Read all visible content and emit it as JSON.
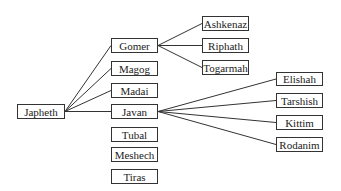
{
  "diagram": {
    "root": {
      "id": "japheth",
      "label": "Japheth"
    },
    "sons": [
      {
        "id": "gomer",
        "label": "Gomer",
        "linked": true
      },
      {
        "id": "magog",
        "label": "Magog",
        "linked": true
      },
      {
        "id": "madai",
        "label": "Madai",
        "linked": true
      },
      {
        "id": "javan",
        "label": "Javan",
        "linked": true
      },
      {
        "id": "tubal",
        "label": "Tubal",
        "linked": false
      },
      {
        "id": "meshech",
        "label": "Meshech",
        "linked": false
      },
      {
        "id": "tiras",
        "label": "Tiras",
        "linked": false
      }
    ],
    "gomer_sons": [
      {
        "id": "ashkenaz",
        "label": "Ashkenaz"
      },
      {
        "id": "riphath",
        "label": "Riphath"
      },
      {
        "id": "togarmah",
        "label": "Togarmah"
      }
    ],
    "javan_sons": [
      {
        "id": "elishah",
        "label": "Elishah"
      },
      {
        "id": "tarshish",
        "label": "Tarshish"
      },
      {
        "id": "kittim",
        "label": "Kittim"
      },
      {
        "id": "rodanim",
        "label": "Rodanim"
      }
    ],
    "edges": [
      [
        "japheth",
        "gomer"
      ],
      [
        "japheth",
        "magog"
      ],
      [
        "japheth",
        "madai"
      ],
      [
        "japheth",
        "javan"
      ],
      [
        "gomer",
        "ashkenaz"
      ],
      [
        "gomer",
        "riphath"
      ],
      [
        "gomer",
        "togarmah"
      ],
      [
        "javan",
        "elishah"
      ],
      [
        "javan",
        "tarshish"
      ],
      [
        "javan",
        "kittim"
      ],
      [
        "javan",
        "rodanim"
      ]
    ]
  }
}
